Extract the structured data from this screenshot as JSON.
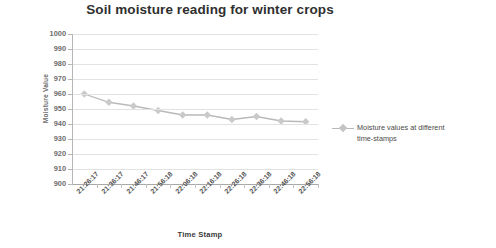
{
  "chart_data": {
    "type": "line",
    "title": "Soil moisture reading for winter crops",
    "xlabel": "Time Stamp",
    "ylabel": "Moisture Value",
    "categories": [
      "21:26:17",
      "21:36:17",
      "21:46:17",
      "21:56:18",
      "22:06:18",
      "22:16:18",
      "22:26:18",
      "22:36:18",
      "22:46:18",
      "22:56:18"
    ],
    "series": [
      {
        "name": "Moisture values at different time-stamps",
        "values": [
          960,
          954.5,
          952,
          949,
          946,
          946,
          943,
          945,
          942,
          941.5
        ]
      }
    ],
    "ylim": [
      900,
      1000
    ],
    "yticks": [
      1000,
      990,
      980,
      970,
      960,
      950,
      940,
      930,
      920,
      910,
      900
    ],
    "grid": true,
    "legend_position": "right",
    "series_color": "#b9b9b9",
    "marker": "diamond"
  },
  "legend": {
    "line1": "Moisture values at different",
    "line2": "time-stamps"
  }
}
